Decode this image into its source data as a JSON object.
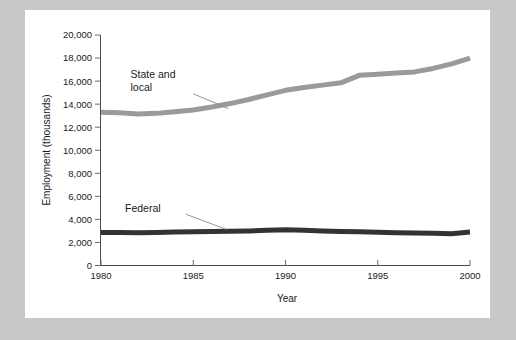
{
  "figure": {
    "panel_background": "#ffffff",
    "outer_background": "#c9c9c9"
  },
  "chart_data": {
    "type": "line",
    "title": "",
    "subtitle": "",
    "xlabel": "Year",
    "ylabel": "Employment (thousands)",
    "xlim": [
      1980,
      2000
    ],
    "ylim": [
      0,
      20000
    ],
    "grid": false,
    "legend_position": "inline-annotation",
    "xticks": [
      1980,
      1985,
      1990,
      1995,
      2000
    ],
    "xtick_labels": [
      "1980",
      "1985",
      "1990",
      "1995",
      "2000"
    ],
    "yticks": [
      0,
      2000,
      4000,
      6000,
      8000,
      10000,
      12000,
      14000,
      16000,
      18000,
      20000
    ],
    "ytick_labels": [
      "0",
      "2,000",
      "4,000",
      "6,000",
      "8,000",
      "10,000",
      "12,000",
      "14,000",
      "16,000",
      "18,000",
      "20,000"
    ],
    "x": [
      1980,
      1981,
      1982,
      1983,
      1984,
      1985,
      1986,
      1987,
      1988,
      1989,
      1990,
      1991,
      1992,
      1993,
      1994,
      1995,
      1996,
      1997,
      1998,
      1999,
      2000
    ],
    "series": [
      {
        "name": "State and local",
        "color": "#9a9a9a",
        "line_width": 5,
        "values": [
          13300,
          13250,
          13150,
          13200,
          13350,
          13500,
          13750,
          14050,
          14400,
          14800,
          15200,
          15450,
          15650,
          15850,
          16500,
          16600,
          16700,
          16800,
          17100,
          17500,
          18000
        ]
      },
      {
        "name": "Federal",
        "color": "#333333",
        "line_width": 5,
        "values": [
          2870,
          2860,
          2850,
          2870,
          2900,
          2930,
          2950,
          2980,
          3000,
          3050,
          3100,
          3050,
          3000,
          2960,
          2920,
          2880,
          2850,
          2830,
          2800,
          2760,
          2900
        ]
      }
    ],
    "annotations": [
      {
        "id": "state-local",
        "text_lines": [
          "State and",
          "local"
        ],
        "label_x": 1981.6,
        "label_y": 16300,
        "leader_from": [
          1985.0,
          14900
        ],
        "leader_to": [
          1986.9,
          13620
        ]
      },
      {
        "id": "federal",
        "text_lines": [
          "Federal"
        ],
        "label_x": 1981.3,
        "label_y": 4650,
        "leader_from": [
          1984.6,
          4450
        ],
        "leader_to": [
          1986.8,
          3130
        ]
      }
    ]
  }
}
